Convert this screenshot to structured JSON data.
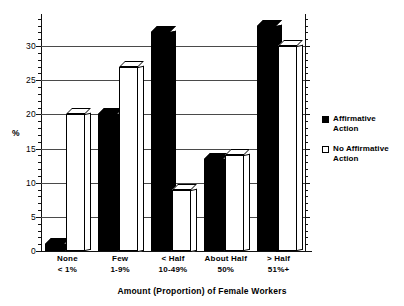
{
  "chart_data": {
    "type": "bar",
    "title": "",
    "xlabel": "Amount (Proportion) of Female Workers",
    "ylabel": "%",
    "ylim": [
      0,
      34
    ],
    "yticks": [
      0,
      5,
      10,
      15,
      20,
      25,
      30
    ],
    "ytick_labels": [
      "0",
      "5",
      "10",
      "15",
      "20",
      "25",
      "30"
    ],
    "grid": "horizontal",
    "legend_position": "right",
    "categories": [
      "None\n< 1%",
      "Few\n1-9%",
      "< Half\n10-49%",
      "About Half\n50%",
      "> Half\n51%+"
    ],
    "category_lines": [
      [
        "None",
        "< 1%"
      ],
      [
        "Few",
        "1-9%"
      ],
      [
        "< Half",
        "10-49%"
      ],
      [
        "About Half",
        "50%"
      ],
      [
        "> Half",
        "51%+"
      ]
    ],
    "series": [
      {
        "name": "Affirmative Action",
        "style": "filled",
        "color": "#000000",
        "values": [
          1,
          20,
          32,
          13.5,
          33
        ]
      },
      {
        "name": "No Affirmative Action",
        "style": "hollow",
        "color": "#ffffff",
        "values": [
          20,
          27,
          9,
          14,
          30
        ]
      }
    ]
  },
  "axis": {
    "y_title": "%",
    "x_title": "Amount (Proportion) of Female Workers"
  },
  "legend": {
    "items": [
      {
        "label_line1": "Affirmative",
        "label_line2": "Action",
        "style": "filled"
      },
      {
        "label_line1": "No Affirmative",
        "label_line2": "Action",
        "style": "hollow"
      }
    ]
  }
}
